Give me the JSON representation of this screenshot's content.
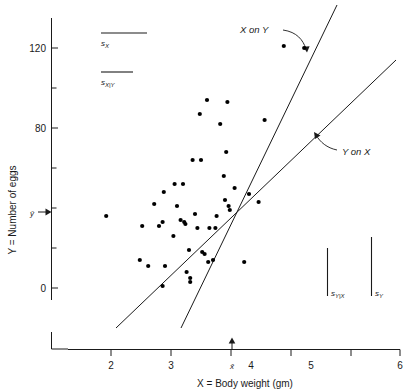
{
  "chart_data": {
    "type": "scatter",
    "title": "",
    "xlabel": "X = Body weight (gm)",
    "ylabel": "Y = Number of eggs",
    "xlim": [
      1.5,
      6.0
    ],
    "ylim": [
      -40,
      140
    ],
    "xticks": [
      2,
      3,
      4,
      5,
      6
    ],
    "xtick_labels": [
      "2",
      "3",
      "4",
      "5",
      "6"
    ],
    "yticks": [
      0,
      20,
      40,
      60,
      80,
      100,
      120
    ],
    "ytick_labels": [
      "0",
      "",
      "",
      "",
      "80",
      "",
      "120"
    ],
    "grid": false,
    "legend": "none",
    "x_mean": 3.52,
    "y_mean": 38,
    "x_mean_label": "x̄",
    "y_mean_label": "ŷ",
    "points": [
      {
        "x": 1.92,
        "y": 36
      },
      {
        "x": 2.48,
        "y": 14
      },
      {
        "x": 2.52,
        "y": 31
      },
      {
        "x": 2.62,
        "y": 11
      },
      {
        "x": 2.72,
        "y": 42
      },
      {
        "x": 2.8,
        "y": 31
      },
      {
        "x": 2.86,
        "y": 1
      },
      {
        "x": 2.86,
        "y": 33
      },
      {
        "x": 2.88,
        "y": 48
      },
      {
        "x": 2.9,
        "y": 11
      },
      {
        "x": 3.04,
        "y": 26
      },
      {
        "x": 3.06,
        "y": 52
      },
      {
        "x": 3.1,
        "y": 41
      },
      {
        "x": 3.16,
        "y": 34
      },
      {
        "x": 3.2,
        "y": 52
      },
      {
        "x": 3.22,
        "y": 33
      },
      {
        "x": 3.24,
        "y": 32
      },
      {
        "x": 3.26,
        "y": 8
      },
      {
        "x": 3.3,
        "y": 19
      },
      {
        "x": 3.32,
        "y": 5
      },
      {
        "x": 3.32,
        "y": 3
      },
      {
        "x": 3.36,
        "y": 64
      },
      {
        "x": 3.4,
        "y": 37
      },
      {
        "x": 3.44,
        "y": 30
      },
      {
        "x": 3.48,
        "y": 87
      },
      {
        "x": 3.5,
        "y": 64
      },
      {
        "x": 3.52,
        "y": 18
      },
      {
        "x": 3.56,
        "y": 17
      },
      {
        "x": 3.6,
        "y": 94
      },
      {
        "x": 3.62,
        "y": 13
      },
      {
        "x": 3.64,
        "y": 30
      },
      {
        "x": 3.7,
        "y": 14
      },
      {
        "x": 3.74,
        "y": 30
      },
      {
        "x": 3.76,
        "y": 36
      },
      {
        "x": 3.82,
        "y": 82
      },
      {
        "x": 3.88,
        "y": 56
      },
      {
        "x": 3.9,
        "y": 44
      },
      {
        "x": 3.92,
        "y": 68
      },
      {
        "x": 3.94,
        "y": 93
      },
      {
        "x": 3.96,
        "y": 41
      },
      {
        "x": 3.98,
        "y": 39
      },
      {
        "x": 4.06,
        "y": 50
      },
      {
        "x": 4.22,
        "y": 13
      },
      {
        "x": 4.3,
        "y": 47
      },
      {
        "x": 4.46,
        "y": 43
      },
      {
        "x": 4.56,
        "y": 84
      },
      {
        "x": 4.88,
        "y": 121
      },
      {
        "x": 5.22,
        "y": 120
      }
    ],
    "lines": [
      {
        "name": "X on Y",
        "label": "X on Y",
        "x1": 2.72,
        "y1": -38,
        "x2": 4.28,
        "y2": 142
      },
      {
        "name": "Y on X",
        "label": "Y on X",
        "x1": 1.74,
        "y1": -38,
        "x2": 5.76,
        "y2": 114
      }
    ],
    "rulers": [
      {
        "name": "s_X",
        "orient": "horizontal",
        "label": "s",
        "sub": "X"
      },
      {
        "name": "s_X|Y",
        "orient": "horizontal",
        "label": "s",
        "sub": "X|Y"
      },
      {
        "name": "s_Y|X",
        "orient": "vertical",
        "label": "s",
        "sub": "Y|X"
      },
      {
        "name": "s_Y",
        "orient": "vertical",
        "label": "s",
        "sub": "Y"
      }
    ]
  },
  "figure": {
    "axis_color": "#1a1a1a",
    "point_color": "#000000",
    "background": "#ffffff"
  }
}
